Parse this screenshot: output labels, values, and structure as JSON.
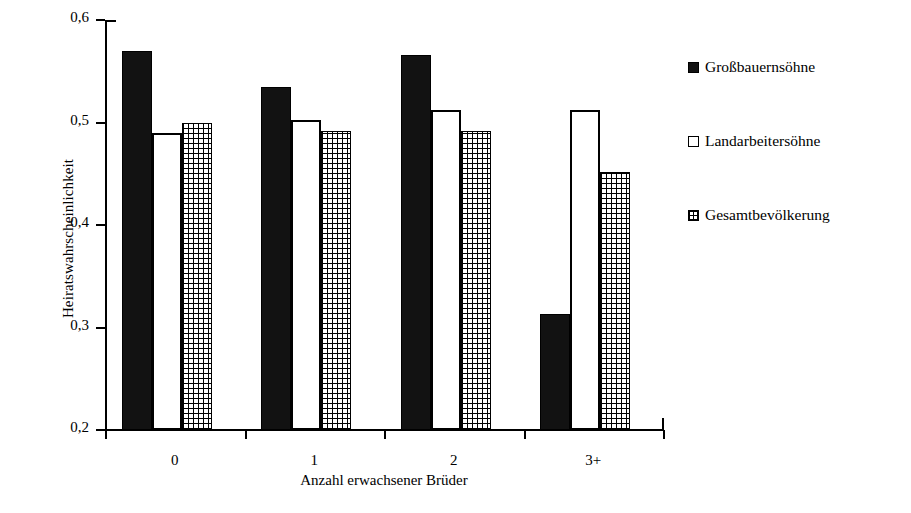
{
  "chart_data": {
    "type": "bar",
    "title": "",
    "subtitle": "",
    "xlabel": "Anzahl erwachsener Brüder",
    "ylabel": "Heiratswahrscheinlichkeit",
    "categories": [
      "0",
      "1",
      "2",
      "3+"
    ],
    "series": [
      {
        "name": "Großbauernsöhne",
        "style": "solid-black",
        "values": [
          0.57,
          0.535,
          0.566,
          0.313
        ]
      },
      {
        "name": "Landarbeitersöhne",
        "style": "open-white",
        "values": [
          0.49,
          0.502,
          0.512,
          0.512
        ]
      },
      {
        "name": "Gesamtbevölkerung",
        "style": "cross-hatch",
        "values": [
          0.5,
          0.492,
          0.492,
          0.452
        ]
      }
    ],
    "ylim": [
      0.2,
      0.6
    ],
    "yticks": [
      "0,2",
      "0,3",
      "0,4",
      "0,5",
      "0,6"
    ],
    "ytick_values": [
      0.2,
      0.3,
      0.4,
      0.5,
      0.6
    ],
    "grid": false,
    "legend_position": "right",
    "decimal_separator": ","
  },
  "legend": {
    "items": [
      {
        "label": "Großbauernsöhne"
      },
      {
        "label": "Landarbeitersöhne"
      },
      {
        "label": "Gesamtbevölkerung"
      }
    ]
  },
  "colors": {
    "series_solid": "#121212",
    "series_open": "#ffffff",
    "series_hatch": "#000000",
    "axis": "#000000",
    "background": "#ffffff"
  }
}
